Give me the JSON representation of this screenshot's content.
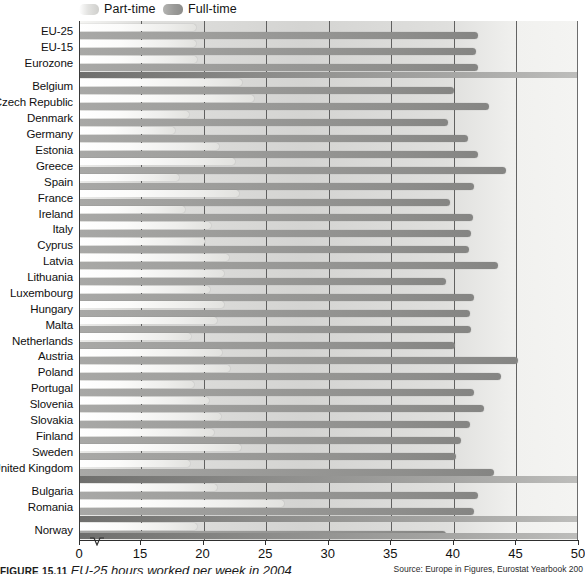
{
  "legend": {
    "items": [
      {
        "label": "Part-time",
        "key": "part",
        "color": "#e6e6e3"
      },
      {
        "label": "Full-time",
        "key": "full",
        "color": "#9a9a98"
      }
    ]
  },
  "caption": {
    "figure_number": "FIGURE 15.11",
    "title": "EU-25 hours worked per week in 2004",
    "source": "Source: Europe in Figures, Eurostat Yearbook 200"
  },
  "chart_data": {
    "type": "bar",
    "orientation": "horizontal",
    "title": "EU-25 hours worked per week in 2004",
    "xlabel": "",
    "ylabel": "",
    "xlim": [
      15,
      50
    ],
    "xticks": [
      0,
      15,
      20,
      25,
      30,
      35,
      40,
      45,
      50
    ],
    "axis_break": true,
    "axis_break_between": [
      0,
      15
    ],
    "grid": true,
    "grid_axis": "x",
    "legend_position": "top-left",
    "categories": [
      "EU-25",
      "EU-15",
      "Eurozone",
      "Belgium",
      "Czech Republic",
      "Denmark",
      "Germany",
      "Estonia",
      "Greece",
      "Spain",
      "France",
      "Ireland",
      "Italy",
      "Cyprus",
      "Latvia",
      "Lithuania",
      "Luxembourg",
      "Hungary",
      "Malta",
      "Netherlands",
      "Austria",
      "Poland",
      "Portugal",
      "Slovenia",
      "Slovakia",
      "Finland",
      "Sweden",
      "United Kingdom",
      "Bulgaria",
      "Romania",
      "Norway"
    ],
    "group_separators_after": [
      "Eurozone",
      "United Kingdom",
      "Romania"
    ],
    "series": [
      {
        "name": "Part-time",
        "color": "#e6e6e3",
        "values": [
          19.4,
          19.4,
          19.5,
          23.1,
          24.0,
          18.8,
          17.7,
          21.2,
          22.5,
          18.0,
          22.8,
          18.5,
          20.6,
          20.1,
          22.0,
          21.6,
          20.5,
          21.6,
          21.1,
          19.0,
          21.5,
          22.1,
          19.2,
          20.4,
          21.4,
          20.8,
          23.0,
          18.9,
          21.1,
          26.4,
          19.5
        ]
      },
      {
        "name": "Full-time",
        "color": "#9a9a98",
        "values": [
          41.9,
          41.8,
          41.9,
          40.0,
          42.8,
          39.5,
          41.1,
          41.9,
          44.2,
          41.6,
          39.7,
          41.5,
          41.4,
          41.2,
          43.5,
          39.4,
          41.6,
          41.3,
          41.4,
          40.1,
          45.1,
          43.8,
          41.6,
          42.4,
          41.3,
          40.6,
          40.2,
          43.2,
          41.9,
          41.6,
          39.4
        ]
      }
    ]
  }
}
